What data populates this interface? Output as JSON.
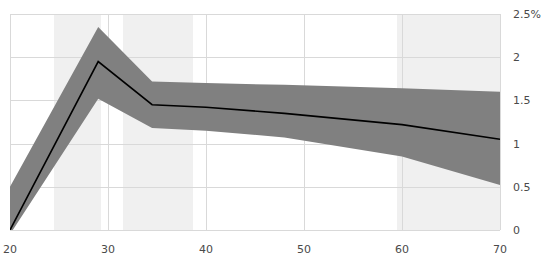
{
  "chart_data": {
    "type": "line",
    "title": "",
    "subtitle": "",
    "xlabel": "",
    "ylabel": "",
    "xlim": [
      20,
      70
    ],
    "ylim": [
      0,
      2.5
    ],
    "grid": true,
    "legend": null,
    "y_unit": "%",
    "xticks": [
      20,
      30,
      40,
      50,
      60,
      70
    ],
    "xtick_labels": [
      "20",
      "30",
      "40",
      "50",
      "60",
      "70"
    ],
    "yticks": [
      0,
      0.5,
      1,
      1.5,
      2,
      2.5
    ],
    "ytick_labels": [
      "0",
      "0.5",
      "1",
      "1.5",
      "2",
      "2.5%"
    ],
    "line_color": "#000000",
    "band_color": "#808080",
    "highlight_band_color": "#f0f0f0",
    "x": [
      20,
      29,
      34.5,
      40,
      48,
      60,
      70
    ],
    "series": [
      {
        "name": "estimate",
        "values": [
          0.0,
          1.95,
          1.45,
          1.42,
          1.35,
          1.22,
          1.05
        ]
      },
      {
        "name": "upper",
        "values": [
          0.5,
          2.35,
          1.72,
          1.7,
          1.68,
          1.64,
          1.6
        ]
      },
      {
        "name": "lower",
        "values": [
          -0.05,
          1.52,
          1.18,
          1.15,
          1.07,
          0.85,
          0.52
        ]
      }
    ],
    "highlight_bands": [
      {
        "start": 24.5,
        "end": 29.3
      },
      {
        "start": 31.5,
        "end": 38.7
      },
      {
        "start": 59.5,
        "end": 70.0
      }
    ]
  }
}
